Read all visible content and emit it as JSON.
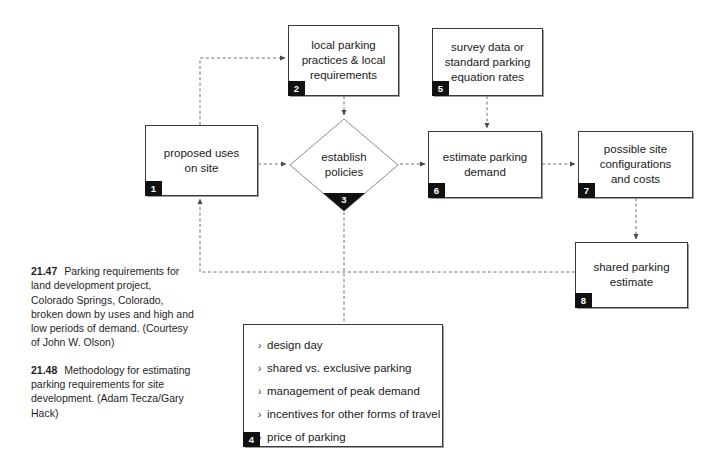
{
  "figure": {
    "type": "flow-diagram",
    "title": "Methodology for estimating parking requirements for site development"
  },
  "nodes": [
    {
      "id": "node1",
      "number": "1",
      "text": "proposed uses\non site",
      "line1": "proposed uses",
      "line2": "on site",
      "line3": ""
    },
    {
      "id": "node2",
      "number": "2",
      "text": "local parking practices & local requirements",
      "line1": "local parking",
      "line2": "practices & local",
      "line3": "requirements"
    },
    {
      "id": "node5",
      "number": "5",
      "text": "survey data or standard parking equation rates",
      "line1": "survey data or",
      "line2": "standard parking",
      "line3": "equation rates"
    },
    {
      "id": "node6",
      "number": "6",
      "text": "estimate parking demand",
      "line1": "estimate parking",
      "line2": "demand",
      "line3": ""
    },
    {
      "id": "node7",
      "number": "7",
      "text": "possible site configurations and costs",
      "line1": "possible site",
      "line2": "configurations",
      "line3": "and costs"
    },
    {
      "id": "node8",
      "number": "8",
      "text": "shared parking estimate",
      "line1": "shared parking",
      "line2": "estimate",
      "line3": ""
    }
  ],
  "decision": {
    "number": "3",
    "line1": "establish",
    "line2": "policies"
  },
  "list_node": {
    "number": "4",
    "bullet_glyph": "›",
    "items": [
      "design day",
      "shared vs. exclusive parking",
      "management of peak demand",
      "incentives for other forms of travel",
      "price of parking"
    ]
  },
  "captions": [
    {
      "number": "21.47",
      "body": "Parking requirements for land development project, Colorado Springs, Colorado, broken down by uses and high and low periods of demand. (Courtesy of John W. Olson)"
    },
    {
      "number": "21.48",
      "body": "Methodology for estimating parking requirements for site development. (Adam Tecza/Gary Hack)"
    }
  ],
  "colors": {
    "background": "#ffffff",
    "box_border": "#3a3a3a",
    "badge_fill": "#111111",
    "badge_text": "#ffffff",
    "connector": "#6e6e6e",
    "text": "#1a1a1a"
  }
}
